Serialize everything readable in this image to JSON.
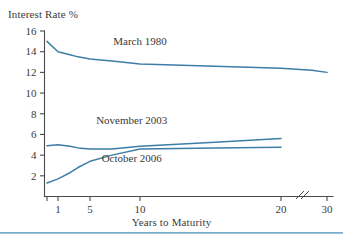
{
  "figure": {
    "name": "yield-curve-figure",
    "background": "#ffffff",
    "line_color": "#3d7ea6",
    "axis_color": "#4a4a4a",
    "text_color": "#3a3a3a",
    "rule_color": "#6ba4c8"
  },
  "chart_data": {
    "type": "line",
    "title": "",
    "subtitle": "",
    "xlabel": "Years to Maturity",
    "ylabel": "Interest Rate %",
    "grid": false,
    "legend_position": "inline-annotations",
    "x_scale": "broken-log-like",
    "xlim": [
      0.5,
      30
    ],
    "ylim": [
      0,
      16
    ],
    "x_ticks": [
      1,
      5,
      10,
      20,
      30
    ],
    "x_tick_labels": [
      "1",
      "5",
      "10",
      "20",
      "30"
    ],
    "y_ticks": [
      2,
      4,
      6,
      8,
      10,
      12,
      14,
      16
    ],
    "y_tick_labels": [
      "2",
      "4",
      "6",
      "8",
      "10",
      "12",
      "14",
      "16"
    ],
    "axis_break": {
      "between": [
        20,
        30
      ],
      "style": "double-slash"
    },
    "series": [
      {
        "name": "March 1980",
        "color": "#3d7ea6",
        "x": [
          0.5,
          1,
          2,
          3,
          5,
          7,
          10,
          15,
          20,
          25,
          30
        ],
        "values": [
          15.0,
          14.0,
          13.7,
          13.5,
          13.3,
          13.1,
          12.8,
          12.6,
          12.4,
          12.2,
          12.0
        ],
        "label_position": {
          "x": 10,
          "y": 14.6
        }
      },
      {
        "name": "November 2003",
        "color": "#3d7ea6",
        "x": [
          0.5,
          1,
          2,
          3,
          5,
          7,
          10,
          15,
          20
        ],
        "values": [
          4.9,
          5.0,
          4.85,
          4.7,
          4.6,
          4.6,
          4.85,
          5.25,
          5.6
        ],
        "label_position": {
          "x": 9,
          "y": 7.0
        }
      },
      {
        "name": "October 2006",
        "color": "#3d7ea6",
        "x": [
          0.5,
          1,
          2,
          3,
          5,
          7,
          10,
          15,
          20
        ],
        "values": [
          1.3,
          1.7,
          2.3,
          2.8,
          3.4,
          4.0,
          4.6,
          4.7,
          4.75
        ],
        "label_position": {
          "x": 9,
          "y": 3.3
        }
      }
    ]
  },
  "annotations": [
    {
      "id": "march-1980-label",
      "text": "March 1980"
    },
    {
      "id": "november-2003-label",
      "text": "November 2003"
    },
    {
      "id": "october-2006-label",
      "text": "October 2006"
    }
  ],
  "axis_titles": {
    "y": "Interest Rate %",
    "x": "Years to Maturity"
  }
}
